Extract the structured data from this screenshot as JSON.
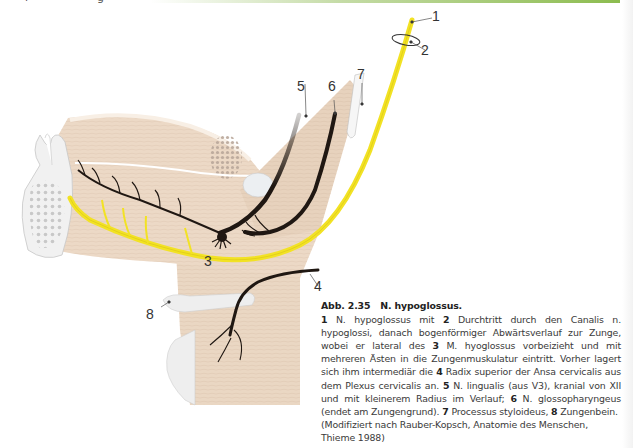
{
  "header": {
    "cut_text_left": "r",
    "cut_text_mid": "g",
    "accent_bar_color": "#8cbc4f"
  },
  "figure": {
    "labels": [
      {
        "id": "1",
        "text": "1"
      },
      {
        "id": "2",
        "text": "2"
      },
      {
        "id": "3",
        "text": "3"
      },
      {
        "id": "4",
        "text": "4"
      },
      {
        "id": "5",
        "text": "5"
      },
      {
        "id": "6",
        "text": "6"
      },
      {
        "id": "7",
        "text": "7"
      },
      {
        "id": "8",
        "text": "8"
      }
    ],
    "colors": {
      "nerve_hypoglossus": "#f2e224",
      "nerve_dark": "#1f1712",
      "tissue": "#ecd9c6",
      "bone": "#eeeeee"
    }
  },
  "caption": {
    "number": "Abb. 2.35",
    "title": "N. hypoglossus.",
    "segments": [
      {
        "b": "1",
        "t": " N. hypoglossus mit "
      },
      {
        "b": "2",
        "t": " Durchtritt durch den Canalis n. hypoglossi, danach bogenförmiger Abwärtsverlauf zur Zunge, wobei er lateral des "
      },
      {
        "b": "3",
        "t": " M. hyoglossus vorbeizieht und mit mehreren Ästen in die Zungenmuskulatur eintritt. Vorher lagert sich ihm intermediär die "
      },
      {
        "b": "4",
        "t": " Radix superior der Ansa cervicalis aus dem Plexus cervicalis an. "
      },
      {
        "b": "5",
        "t": " N. lingualis (aus V3), kranial von XII und mit kleinerem Radius im Verlauf; "
      },
      {
        "b": "6",
        "t": " N. glossopharyngeus (endet am Zungengrund). "
      },
      {
        "b": "7",
        "t": " Processus styloideus, "
      },
      {
        "b": "8",
        "t": " Zungenbein."
      }
    ],
    "credit": "(Modifiziert nach Rauber-Kopsch, Anatomie des Menschen, Thieme 1988)"
  }
}
